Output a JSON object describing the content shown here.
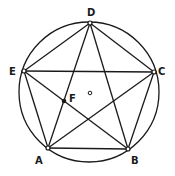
{
  "diagram": {
    "type": "geometry",
    "stroke_color": "#1a1a1a",
    "circle": {
      "cx": 89,
      "cy": 92,
      "r": 70
    },
    "center_marker": {
      "label": "o",
      "x": 90,
      "y": 93
    },
    "vertices": [
      {
        "id": "D",
        "label": "D",
        "x": 90,
        "y": 23,
        "lx": 87,
        "ly": 16
      },
      {
        "id": "C",
        "label": "C",
        "x": 154,
        "y": 72,
        "lx": 158,
        "ly": 75
      },
      {
        "id": "B",
        "label": "B",
        "x": 128,
        "y": 149,
        "lx": 131,
        "ly": 164
      },
      {
        "id": "A",
        "label": "A",
        "x": 48,
        "y": 148,
        "lx": 35,
        "ly": 164
      },
      {
        "id": "E",
        "label": "E",
        "x": 24,
        "y": 71,
        "lx": 9,
        "ly": 75
      }
    ],
    "point_F": {
      "label": "F",
      "x": 64,
      "y": 101,
      "lx": 69,
      "ly": 102
    },
    "sides": [
      [
        "A",
        "B"
      ],
      [
        "B",
        "C"
      ],
      [
        "C",
        "D"
      ],
      [
        "D",
        "E"
      ],
      [
        "E",
        "A"
      ]
    ],
    "diagonals": [
      [
        "A",
        "C"
      ],
      [
        "A",
        "D"
      ],
      [
        "B",
        "D"
      ],
      [
        "B",
        "E"
      ],
      [
        "C",
        "E"
      ]
    ]
  }
}
